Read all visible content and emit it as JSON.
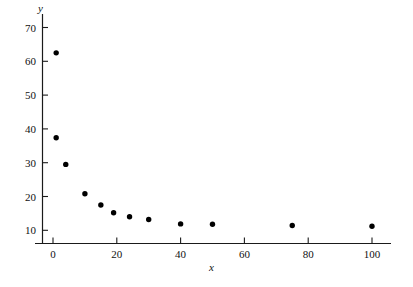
{
  "chart_data": {
    "type": "scatter",
    "title": "",
    "subtitle": "",
    "xlabel": "x",
    "ylabel": "y",
    "xlim": [
      -2,
      110
    ],
    "ylim": [
      7,
      73
    ],
    "grid": false,
    "legend": null,
    "x_ticks": [
      0,
      20,
      40,
      60,
      80,
      100
    ],
    "y_ticks": [
      10,
      20,
      30,
      40,
      50,
      60,
      70
    ],
    "marker": {
      "shape": "circle",
      "color": "#000000",
      "size": 5
    },
    "series": [
      {
        "name": "data",
        "points": [
          {
            "x": 1,
            "y": 62.5
          },
          {
            "x": 1,
            "y": 37.4
          },
          {
            "x": 4,
            "y": 29.5
          },
          {
            "x": 10,
            "y": 20.8
          },
          {
            "x": 15,
            "y": 17.5
          },
          {
            "x": 19,
            "y": 15.2
          },
          {
            "x": 24,
            "y": 14.0
          },
          {
            "x": 30,
            "y": 13.2
          },
          {
            "x": 40,
            "y": 11.9
          },
          {
            "x": 50,
            "y": 11.8
          },
          {
            "x": 75,
            "y": 11.4
          },
          {
            "x": 100,
            "y": 11.2
          }
        ]
      }
    ]
  },
  "axes": {
    "x_axis_label": "x",
    "y_axis_label": "y",
    "x_tick_labels": [
      "0",
      "20",
      "40",
      "60",
      "80",
      "100"
    ],
    "y_tick_labels": [
      "10",
      "20",
      "30",
      "40",
      "50",
      "60",
      "70"
    ],
    "axis_color": "#1a1a1a"
  },
  "colors": {
    "background": "#ffffff",
    "marker": "#000000",
    "axis": "#1a1a1a",
    "text": "#111111"
  }
}
